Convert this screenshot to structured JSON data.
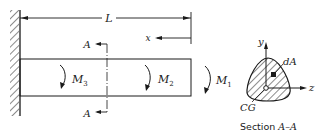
{
  "diagram": {
    "labels": {
      "length": "L",
      "x_axis": "x",
      "section_top": "A",
      "section_bottom": "A",
      "moments": [
        {
          "symbol": "M",
          "subscript": "3"
        },
        {
          "symbol": "M",
          "subscript": "2"
        },
        {
          "symbol": "M",
          "subscript": "1"
        }
      ],
      "section": {
        "y_axis": "y",
        "z_axis": "z",
        "area_element": "dA",
        "centroid": "CG",
        "caption_prefix": "Section ",
        "caption_name": "A–A"
      }
    },
    "colors": {
      "ink": "#1a1a1a",
      "background": "#ffffff"
    }
  }
}
